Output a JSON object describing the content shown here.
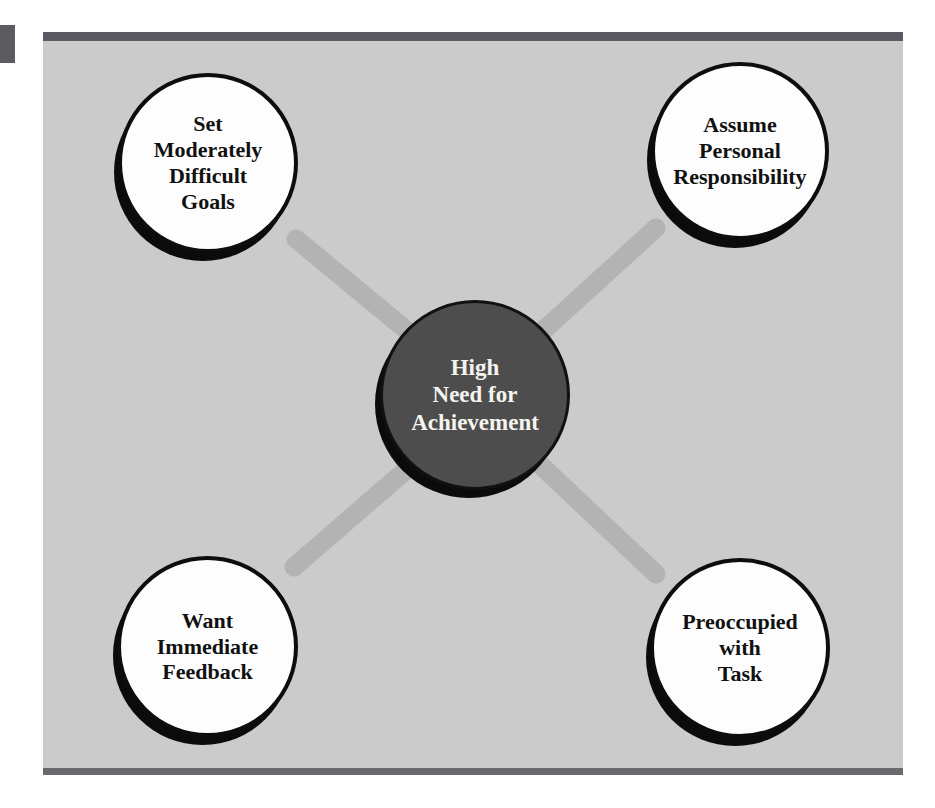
{
  "figure": {
    "type": "hub-and-spoke-diagram",
    "background_color": "#cbcbcb",
    "frame_bar_color": "#5a5a60",
    "spoke_color": "#b3b3b3",
    "center_fill": "#4d4d4d",
    "node_fill": "#fdfdfd",
    "node_outline": "#0d0d0d"
  },
  "center": {
    "label": "High\nNeed for\nAchievement",
    "lines": [
      "High",
      "Need for",
      "Achievement"
    ]
  },
  "nodes": [
    {
      "position": "top-left",
      "label": "Set\nModerately\nDifficult\nGoals",
      "lines": [
        "Set",
        "Moderately",
        "Difficult",
        "Goals"
      ]
    },
    {
      "position": "top-right",
      "label": "Assume\nPersonal\nResponsibility",
      "lines": [
        "Assume",
        "Personal",
        "Responsibility"
      ]
    },
    {
      "position": "bottom-left",
      "label": "Want\nImmediate\nFeedback",
      "lines": [
        "Want",
        "Immediate",
        "Feedback"
      ]
    },
    {
      "position": "bottom-right",
      "label": "Preoccupied\nwith\nTask",
      "lines": [
        "Preoccupied",
        "with",
        "Task"
      ]
    }
  ],
  "connectors": [
    {
      "from": "top-left",
      "to": "center"
    },
    {
      "from": "top-right",
      "to": "center"
    },
    {
      "from": "bottom-left",
      "to": "center"
    },
    {
      "from": "bottom-right",
      "to": "center"
    }
  ]
}
